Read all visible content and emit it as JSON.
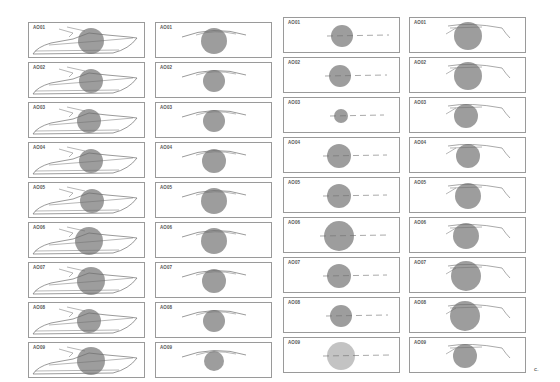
{
  "figure": {
    "columns": [
      {
        "view": "side-view-boat",
        "top": 22,
        "left": 28,
        "panels": [
          {
            "label": "AO01",
            "r": 13,
            "cx": 62
          },
          {
            "label": "AO02",
            "r": 12,
            "cx": 62
          },
          {
            "label": "AO03",
            "r": 12,
            "cx": 60
          },
          {
            "label": "AO04",
            "r": 12,
            "cx": 62
          },
          {
            "label": "AO05",
            "r": 12,
            "cx": 63
          },
          {
            "label": "AO06",
            "r": 14,
            "cx": 60
          },
          {
            "label": "AO07",
            "r": 14,
            "cx": 62
          },
          {
            "label": "AO08",
            "r": 12,
            "cx": 60
          },
          {
            "label": "AO09",
            "r": 14,
            "cx": 62
          }
        ]
      },
      {
        "view": "front-view",
        "top": 22,
        "left": 155,
        "panels": [
          {
            "label": "AO01",
            "r": 13,
            "cx": 58
          },
          {
            "label": "AO02",
            "r": 11,
            "cx": 58
          },
          {
            "label": "AO03",
            "r": 11,
            "cx": 58
          },
          {
            "label": "AO04",
            "r": 12,
            "cx": 58
          },
          {
            "label": "AO05",
            "r": 13,
            "cx": 58
          },
          {
            "label": "AO06",
            "r": 13,
            "cx": 58
          },
          {
            "label": "AO07",
            "r": 12,
            "cx": 58
          },
          {
            "label": "AO08",
            "r": 11,
            "cx": 58
          },
          {
            "label": "AO09",
            "r": 10,
            "cx": 58
          }
        ]
      },
      {
        "view": "top-view",
        "top": 17,
        "left": 283,
        "panels": [
          {
            "label": "AO01",
            "r": 11,
            "cx": 58
          },
          {
            "label": "AO02",
            "r": 11,
            "cx": 56
          },
          {
            "label": "AO03",
            "r": 7,
            "cx": 57
          },
          {
            "label": "AO04",
            "r": 12,
            "cx": 55
          },
          {
            "label": "AO05",
            "r": 12,
            "cx": 55
          },
          {
            "label": "AO06",
            "r": 15,
            "cx": 55
          },
          {
            "label": "AO07",
            "r": 12,
            "cx": 55
          },
          {
            "label": "AO08",
            "r": 11,
            "cx": 57
          },
          {
            "label": "AO09",
            "r": 14,
            "cx": 57
          }
        ]
      },
      {
        "view": "rear-view",
        "top": 17,
        "left": 409,
        "panels": [
          {
            "label": "AO01",
            "r": 14,
            "cx": 58
          },
          {
            "label": "AO02",
            "r": 14,
            "cx": 58
          },
          {
            "label": "AO03",
            "r": 12,
            "cx": 56
          },
          {
            "label": "AO04",
            "r": 12,
            "cx": 58
          },
          {
            "label": "AO05",
            "r": 13,
            "cx": 58
          },
          {
            "label": "AO06",
            "r": 13,
            "cx": 56
          },
          {
            "label": "AO07",
            "r": 15,
            "cx": 56
          },
          {
            "label": "AO08",
            "r": 15,
            "cx": 55
          },
          {
            "label": "AO09",
            "r": 12,
            "cx": 55
          }
        ]
      }
    ],
    "panel_label_corner": "c.",
    "circle_color": "#8c8c8c",
    "light_circle_color": "#b8b8b8",
    "line_color": "#6e6e6e"
  }
}
